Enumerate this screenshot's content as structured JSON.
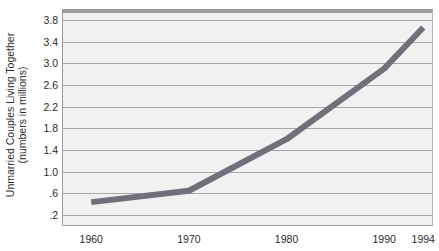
{
  "chart_data": {
    "type": "line",
    "title": "",
    "xlabel": "",
    "ylabel": "Unmarried Couples Living Together",
    "ylabel_line2": "(numbers in millions)",
    "x": [
      1960,
      1970,
      1980,
      1990,
      1994
    ],
    "values": [
      0.44,
      0.65,
      1.6,
      2.9,
      3.66
    ],
    "categories": [
      "1960",
      "1970",
      "1980",
      "1990",
      "1994"
    ],
    "xticklabels": [
      "1960",
      "1970",
      "1980",
      "1990",
      "1994"
    ],
    "yticklabels": [
      "3.8",
      "3.4",
      "3.0",
      "2.6",
      "2.2",
      "1.8",
      "1.4",
      "1.0",
      ".6",
      ".2"
    ],
    "ytickvalues": [
      3.8,
      3.4,
      3.0,
      2.6,
      2.2,
      1.8,
      1.4,
      1.0,
      0.6,
      0.2
    ],
    "ylim": [
      0.0,
      4.0
    ],
    "xlim": [
      1957,
      1995
    ],
    "grid": true,
    "legend": false,
    "series": [
      {
        "name": "Unmarried Couples Living Together",
        "values": [
          0.44,
          0.65,
          1.6,
          2.9,
          3.66
        ],
        "color": "#70707a"
      }
    ],
    "colors": {
      "line": "#70707a",
      "plot_background": "#f1f1f1",
      "gridline": "#a8a8a8",
      "border": "#9b9b9b",
      "text": "#2b2b2b",
      "page_background": "#ffffff"
    }
  }
}
